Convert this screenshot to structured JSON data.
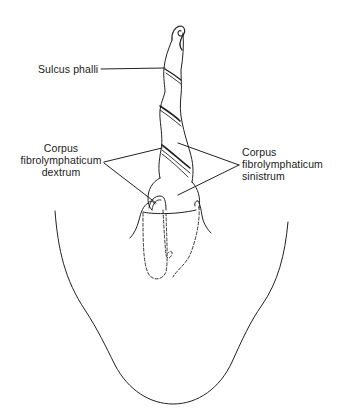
{
  "figure": {
    "colors": {
      "line": "#222222",
      "background": "#ffffff"
    },
    "labels": {
      "sulcus_phalli": "Sulcus phalli",
      "dextrum": {
        "line1": "Corpus",
        "line2": "fibrolymphaticum",
        "line3": "dextrum"
      },
      "sinistrum": {
        "line1": "Corpus",
        "line2": "fibrolymphaticum",
        "line3": "sinistrum"
      }
    }
  }
}
